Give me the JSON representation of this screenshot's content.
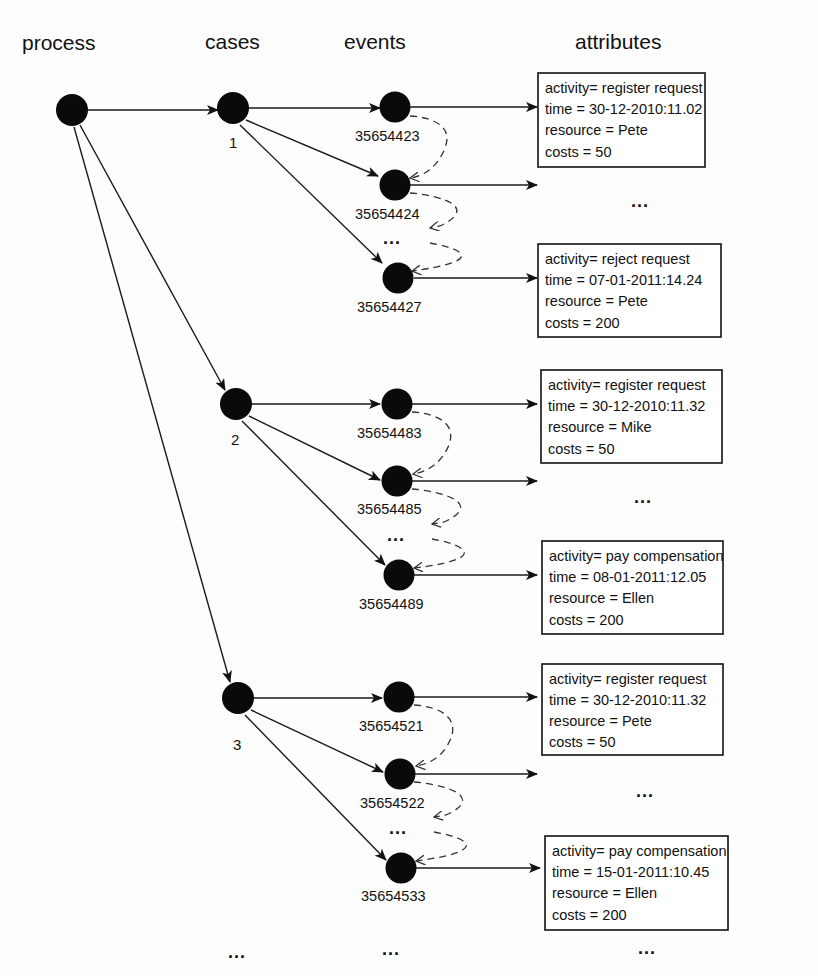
{
  "headers": {
    "process": "process",
    "cases": "cases",
    "events": "events",
    "attributes": "attributes"
  },
  "colors": {
    "node": "#0a0a0a",
    "line": "#1a1a1a",
    "background": "#fdfdfd"
  },
  "ellipsis": "...",
  "cases": [
    {
      "id": "1",
      "events": [
        {
          "id": "35654423",
          "attributes": {
            "activity": "activity= register request",
            "time": "time = 30-12-2010:11.02",
            "resource": "resource = Pete",
            "costs": "costs = 50"
          }
        },
        {
          "id": "35654424"
        },
        {
          "id": "35654427",
          "attributes": {
            "activity": "activity= reject request",
            "time": "time = 07-01-2011:14.24",
            "resource": "resource = Pete",
            "costs": "costs = 200"
          }
        }
      ]
    },
    {
      "id": "2",
      "events": [
        {
          "id": "35654483",
          "attributes": {
            "activity": "activity= register request",
            "time": "time = 30-12-2010:11.32",
            "resource": "resource = Mike",
            "costs": "costs = 50"
          }
        },
        {
          "id": "35654485"
        },
        {
          "id": "35654489",
          "attributes": {
            "activity": "activity= pay compensation",
            "time": "time = 08-01-2011:12.05",
            "resource": "resource = Ellen",
            "costs": "costs = 200"
          }
        }
      ]
    },
    {
      "id": "3",
      "events": [
        {
          "id": "35654521",
          "attributes": {
            "activity": "activity= register request",
            "time": "time = 30-12-2010:11.32",
            "resource": "resource = Pete",
            "costs": "costs = 50"
          }
        },
        {
          "id": "35654522"
        },
        {
          "id": "35654533",
          "attributes": {
            "activity": "activity= pay compensation",
            "time": "time = 15-01-2011:10.45",
            "resource": "resource = Ellen",
            "costs": "costs = 200"
          }
        }
      ]
    }
  ]
}
